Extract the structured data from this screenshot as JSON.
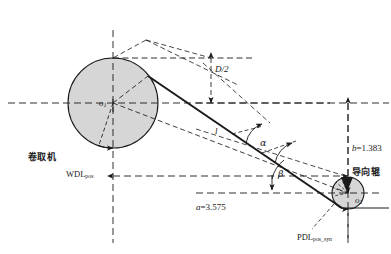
{
  "figure": {
    "kind": "engineering-geometry-diagram",
    "background_color": "#ffffff",
    "line_color": "#1a1a1a",
    "fill_color": "#d4d4d4"
  },
  "components": {
    "coiler": {
      "label": "卷取机",
      "center_label": "o",
      "center_subscript": "1",
      "cx": 113,
      "cy": 103,
      "r": 45
    },
    "guide_roller": {
      "label": "导向辊",
      "center_label": "o",
      "center_subscript": "2",
      "cx": 348,
      "cy": 193,
      "r": 16
    }
  },
  "dimensions": {
    "horizontal": "a=3.575",
    "horizontal_symbol": "a",
    "horizontal_value": "3.575",
    "vertical": "b=1.383",
    "vertical_symbol": "b",
    "vertical_value": "1.383",
    "radius_label": "D/2",
    "length_label": "l"
  },
  "angles": {
    "alpha": "α",
    "beta": "β"
  },
  "signals": {
    "wdl": "WDL",
    "wdl_sub": "pos",
    "pdl": "PDL",
    "pdl_sub": "pos_syn"
  }
}
